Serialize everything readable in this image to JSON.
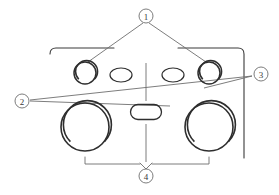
{
  "diagram": {
    "type": "technical-line-drawing",
    "background_color": "#ffffff",
    "line_color": "#3a3a3a",
    "line_color_light": "#6e6e6e",
    "callouts": [
      {
        "id": "1",
        "label": "1",
        "position": "top-center",
        "cx": 146,
        "cy": 16,
        "r": 7,
        "points_to": [
          "upper-left-round-dial",
          "upper-right-round-dial"
        ]
      },
      {
        "id": "2",
        "label": "2",
        "position": "left",
        "cx": 22,
        "cy": 101,
        "r": 7,
        "points_to": [
          "center-pill-button",
          "right-edge-panel"
        ]
      },
      {
        "id": "3",
        "label": "3",
        "position": "right",
        "cx": 261,
        "cy": 74,
        "r": 7,
        "points_to": [
          "right-edge-panel"
        ]
      },
      {
        "id": "4",
        "label": "4",
        "position": "bottom-center",
        "cx": 146,
        "cy": 176,
        "r": 7,
        "points_to": [
          "lower-left-large-dial",
          "lower-right-large-dial"
        ]
      }
    ],
    "shapes": [
      {
        "name": "upper-left-round-dial",
        "kind": "circle",
        "cx": 85,
        "cy": 73,
        "r": 11
      },
      {
        "name": "upper-left-oval-button",
        "kind": "ellipse",
        "cx": 121,
        "cy": 75,
        "rx": 11,
        "ry": 7
      },
      {
        "name": "upper-right-oval-button",
        "kind": "ellipse",
        "cx": 173,
        "cy": 75,
        "rx": 11,
        "ry": 7
      },
      {
        "name": "upper-right-round-dial",
        "kind": "circle",
        "cx": 209,
        "cy": 73,
        "r": 11
      },
      {
        "name": "lower-left-large-dial",
        "kind": "circle",
        "cx": 85,
        "cy": 127,
        "r": 24
      },
      {
        "name": "center-pill-button",
        "kind": "pill",
        "cx": 146,
        "cy": 112,
        "w": 31,
        "h": 15
      },
      {
        "name": "lower-right-large-dial",
        "kind": "circle",
        "cx": 209,
        "cy": 127,
        "r": 24
      }
    ],
    "annotations": {
      "centerline": "vertical dash-dot centerline",
      "top_bracket": "leader lines from callout 1 to upper dials",
      "bottom_bracket": "dimension bracket spanning lower large dials"
    }
  }
}
